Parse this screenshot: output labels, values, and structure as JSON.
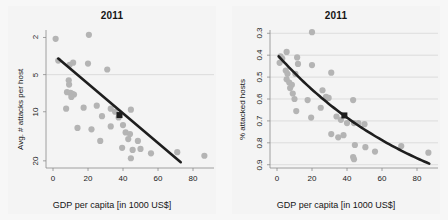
{
  "figure": {
    "background": "#f4f4f4",
    "point_color": "#b4b4b4",
    "line_color": "#1e1e1e",
    "grid_color": "#d2d2d2",
    "axis_color": "#8c8c8c",
    "text_color": "#141414"
  },
  "panels": [
    {
      "id": "left-panel",
      "title": "2011",
      "xlabel": "GDP per capita [in 1000 US$]",
      "ylabel": "Avg. # attacks per host",
      "xticks": [
        "0",
        "20",
        "40",
        "60",
        "80"
      ],
      "yticks": [
        "20",
        "10",
        "5",
        "2"
      ]
    },
    {
      "id": "right-panel",
      "title": "2011",
      "xlabel": "GDP per capita [in 1000 US$]",
      "ylabel": "% attacked hosts",
      "xticks": [
        "0",
        "20",
        "40",
        "60",
        "80"
      ],
      "yticks": [
        "0.9",
        "0.8",
        "0.7",
        "0.6",
        "0.5",
        "0.4",
        "0.3"
      ]
    }
  ],
  "chart_data": [
    {
      "type": "scatter",
      "title": "2011",
      "xlabel": "GDP per capita [in 1000 US$]",
      "ylabel": "Avg. # attacks per host",
      "xlim": [
        -4,
        92
      ],
      "ylim": [
        1.75,
        23
      ],
      "yscale": "log",
      "xticks": [
        0,
        20,
        40,
        60,
        80
      ],
      "yticks": [
        2,
        5,
        10,
        20
      ],
      "grid": "horizontal-at-10",
      "legend": "none",
      "points": [
        {
          "x": 1.5,
          "y": 19.5
        },
        {
          "x": 20.5,
          "y": 21.0
        },
        {
          "x": 3.0,
          "y": 13.0
        },
        {
          "x": 9.5,
          "y": 12.0
        },
        {
          "x": 11.5,
          "y": 12.5
        },
        {
          "x": 20.0,
          "y": 12.3
        },
        {
          "x": 31.0,
          "y": 11.0
        },
        {
          "x": 9.0,
          "y": 9.0
        },
        {
          "x": 9.2,
          "y": 8.3
        },
        {
          "x": 8.0,
          "y": 7.2
        },
        {
          "x": 10.0,
          "y": 7.1
        },
        {
          "x": 11.0,
          "y": 7.0
        },
        {
          "x": 12.0,
          "y": 6.9
        },
        {
          "x": 10.5,
          "y": 6.6
        },
        {
          "x": 7.5,
          "y": 5.3
        },
        {
          "x": 17.5,
          "y": 5.4
        },
        {
          "x": 25.0,
          "y": 5.6
        },
        {
          "x": 33.0,
          "y": 5.3
        },
        {
          "x": 35.5,
          "y": 5.0
        },
        {
          "x": 44.5,
          "y": 5.2
        },
        {
          "x": 28.0,
          "y": 4.6
        },
        {
          "x": 37.5,
          "y": 4.5
        },
        {
          "x": 14.0,
          "y": 3.7
        },
        {
          "x": 22.0,
          "y": 3.6
        },
        {
          "x": 33.0,
          "y": 3.8
        },
        {
          "x": 40.0,
          "y": 3.9
        },
        {
          "x": 41.5,
          "y": 3.4
        },
        {
          "x": 44.0,
          "y": 3.3
        },
        {
          "x": 27.0,
          "y": 2.9
        },
        {
          "x": 43.0,
          "y": 3.0
        },
        {
          "x": 48.5,
          "y": 2.9
        },
        {
          "x": 39.5,
          "y": 2.55
        },
        {
          "x": 45.5,
          "y": 2.45
        },
        {
          "x": 50.0,
          "y": 2.5
        },
        {
          "x": 56.0,
          "y": 2.3
        },
        {
          "x": 71.0,
          "y": 2.35
        },
        {
          "x": 44.5,
          "y": 2.1
        },
        {
          "x": 86.5,
          "y": 2.2
        }
      ],
      "highlight_point": {
        "x": 38.0,
        "y": 4.7,
        "marker": "square",
        "color": "#1e1e1e"
      },
      "trend_line": {
        "style": "straight",
        "x0": 3.0,
        "y0": 13.5,
        "x1": 73.0,
        "y1": 1.95
      }
    },
    {
      "type": "scatter",
      "title": "2011",
      "xlabel": "GDP per capita [in 1000 US$]",
      "ylabel": "% attacked hosts",
      "xlim": [
        -4,
        92
      ],
      "ylim": [
        0.285,
        0.915
      ],
      "yscale": "linear",
      "xticks": [
        0,
        20,
        40,
        60,
        80
      ],
      "yticks": [
        0.3,
        0.4,
        0.5,
        0.6,
        0.7,
        0.8,
        0.9
      ],
      "grid": "horizontal-all",
      "legend": "none",
      "points": [
        {
          "x": 20.0,
          "y": 0.905
        },
        {
          "x": 5.5,
          "y": 0.815
        },
        {
          "x": 2.0,
          "y": 0.795
        },
        {
          "x": 3.0,
          "y": 0.785
        },
        {
          "x": 11.5,
          "y": 0.79
        },
        {
          "x": 1.5,
          "y": 0.765
        },
        {
          "x": 12.0,
          "y": 0.76
        },
        {
          "x": 20.0,
          "y": 0.755
        },
        {
          "x": 5.0,
          "y": 0.73
        },
        {
          "x": 6.0,
          "y": 0.715
        },
        {
          "x": 10.5,
          "y": 0.715
        },
        {
          "x": 31.0,
          "y": 0.72
        },
        {
          "x": 5.5,
          "y": 0.69
        },
        {
          "x": 7.0,
          "y": 0.675
        },
        {
          "x": 8.5,
          "y": 0.665
        },
        {
          "x": 7.5,
          "y": 0.65
        },
        {
          "x": 26.0,
          "y": 0.64
        },
        {
          "x": 9.0,
          "y": 0.625
        },
        {
          "x": 28.0,
          "y": 0.61
        },
        {
          "x": 29.5,
          "y": 0.605
        },
        {
          "x": 10.0,
          "y": 0.6
        },
        {
          "x": 17.5,
          "y": 0.595
        },
        {
          "x": 43.5,
          "y": 0.595
        },
        {
          "x": 25.0,
          "y": 0.56
        },
        {
          "x": 11.0,
          "y": 0.545
        },
        {
          "x": 19.5,
          "y": 0.515
        },
        {
          "x": 34.0,
          "y": 0.52
        },
        {
          "x": 36.5,
          "y": 0.505
        },
        {
          "x": 40.0,
          "y": 0.49
        },
        {
          "x": 44.0,
          "y": 0.49
        },
        {
          "x": 46.5,
          "y": 0.49
        },
        {
          "x": 50.0,
          "y": 0.485
        },
        {
          "x": 31.0,
          "y": 0.44
        },
        {
          "x": 38.0,
          "y": 0.435
        },
        {
          "x": 35.0,
          "y": 0.425
        },
        {
          "x": 44.5,
          "y": 0.39
        },
        {
          "x": 50.5,
          "y": 0.38
        },
        {
          "x": 71.0,
          "y": 0.385
        },
        {
          "x": 56.0,
          "y": 0.36
        },
        {
          "x": 86.5,
          "y": 0.355
        },
        {
          "x": 43.5,
          "y": 0.335
        },
        {
          "x": 44.0,
          "y": 0.325
        }
      ],
      "highlight_point": {
        "x": 38.5,
        "y": 0.525,
        "marker": "square",
        "color": "#1e1e1e"
      },
      "trend_line": {
        "style": "curved",
        "x0": 1.0,
        "y0": 0.795,
        "x1": 87.0,
        "y1": 0.305
      }
    }
  ]
}
